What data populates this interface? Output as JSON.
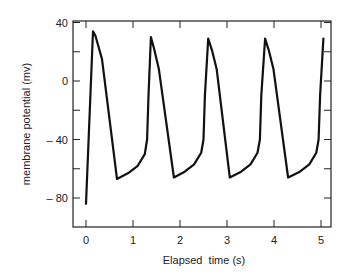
{
  "chart_data": {
    "type": "line",
    "title": "",
    "xlabel": "Elapsed  time (s)",
    "ylabel": "membrane potential (mv)",
    "xlim": [
      -0.27,
      5.2
    ],
    "ylim": [
      -100,
      40
    ],
    "xticks": [
      0,
      1,
      2,
      3,
      4,
      5
    ],
    "xtick_labels": [
      "0",
      "1",
      "2",
      "3",
      "4",
      "5"
    ],
    "yticks": [
      40,
      20,
      0,
      -20,
      -40,
      -60,
      -80
    ],
    "ytick_labels": [
      "40",
      "",
      "0",
      "",
      "– 40",
      "",
      "– 80"
    ],
    "grid": false,
    "legend": null,
    "series": [
      {
        "name": "membrane potential",
        "x": [
          0.0,
          0.15,
          0.2,
          0.34,
          0.66,
          0.9,
          1.1,
          1.25,
          1.3,
          1.33,
          1.38,
          1.45,
          1.55,
          1.87,
          2.1,
          2.3,
          2.45,
          2.5,
          2.53,
          2.6,
          2.68,
          2.78,
          3.06,
          3.3,
          3.5,
          3.65,
          3.7,
          3.73,
          3.81,
          3.89,
          3.99,
          4.3,
          4.55,
          4.75,
          4.9,
          4.95,
          4.98,
          5.05
        ],
        "y": [
          -84,
          34,
          31,
          15,
          -67,
          -63,
          -58,
          -50,
          -40,
          -10,
          30,
          22,
          8,
          -66,
          -62,
          -57,
          -49,
          -40,
          -10,
          29,
          21,
          8,
          -66,
          -62,
          -57,
          -49,
          -40,
          -10,
          29,
          21,
          8,
          -66,
          -62,
          -57,
          -49,
          -40,
          -10,
          29
        ]
      }
    ]
  },
  "axes": {
    "x_label": "Elapsed  time (s)",
    "y_label": "membrane potential (mv)",
    "x_ticks": [
      "0",
      "1",
      "2",
      "3",
      "4",
      "5"
    ],
    "y_ticks": [
      "40",
      "0",
      "– 40",
      "– 80"
    ]
  }
}
